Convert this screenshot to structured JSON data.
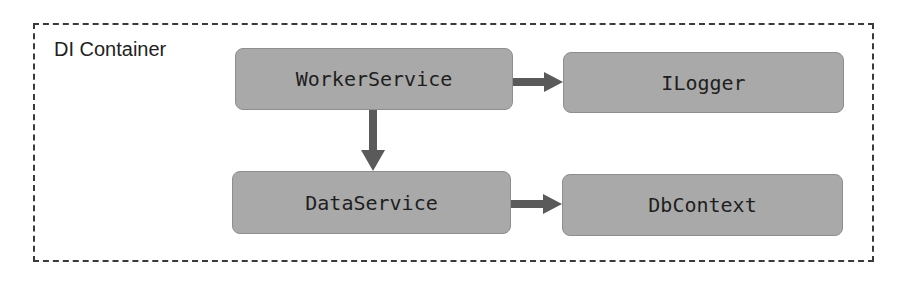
{
  "diagram": {
    "container": {
      "label": "DI Container"
    },
    "nodes": [
      {
        "id": "worker",
        "label": "WorkerService"
      },
      {
        "id": "logger",
        "label": "ILogger"
      },
      {
        "id": "data",
        "label": "DataService"
      },
      {
        "id": "db",
        "label": "DbContext"
      }
    ],
    "edges": [
      {
        "from": "WorkerService",
        "to": "ILogger"
      },
      {
        "from": "WorkerService",
        "to": "DataService"
      },
      {
        "from": "DataService",
        "to": "DbContext"
      }
    ],
    "colors": {
      "node_fill": "#a9a9a9",
      "arrow": "#5a5a5a",
      "border": "#3a3a3a"
    }
  }
}
